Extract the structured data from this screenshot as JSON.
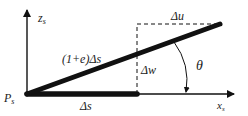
{
  "diagram": {
    "type": "kinematics-element-deformation",
    "colors": {
      "line": "#111111",
      "text": "#222222",
      "background": "#ffffff"
    },
    "labels": {
      "origin": "P",
      "origin_sub": "s",
      "z_axis": "z",
      "z_axis_sub": "s",
      "x_axis": "x",
      "x_axis_sub": "s",
      "deformed_length": "(1+e)Δs",
      "original_length": "Δs",
      "delta_u": "Δu",
      "delta_w": "Δw",
      "angle": "θ"
    },
    "geometry": {
      "origin": [
        27,
        94
      ],
      "undeformed_end": [
        137,
        94
      ],
      "deformed_end": [
        220,
        24
      ],
      "z_axis_top": [
        27,
        8
      ],
      "x_axis_end": [
        236,
        94
      ]
    }
  }
}
